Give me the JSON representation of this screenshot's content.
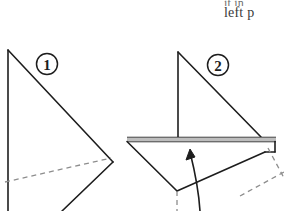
{
  "page": {
    "background_color": "#ffffff",
    "ink_color": "#1d1d1d",
    "fold_line_color": "#9a9a9a",
    "type": "origami-instruction-diagram"
  },
  "caption": {
    "line_1": "it in",
    "line_2": "left p"
  },
  "steps": [
    {
      "number": "1",
      "badge_name": "step-1-badge",
      "figure_name": "figure-step-1",
      "description": "Triangular folded paper with dashed hidden fold line"
    },
    {
      "number": "2",
      "badge_name": "step-2-badge",
      "figure_name": "figure-step-2",
      "description": "Sailboat shape with horizontal deck band, curved fold arrow and dashed hidden edges"
    }
  ],
  "annotations": {
    "fold_arrow_label": "fold-up-arrow"
  }
}
